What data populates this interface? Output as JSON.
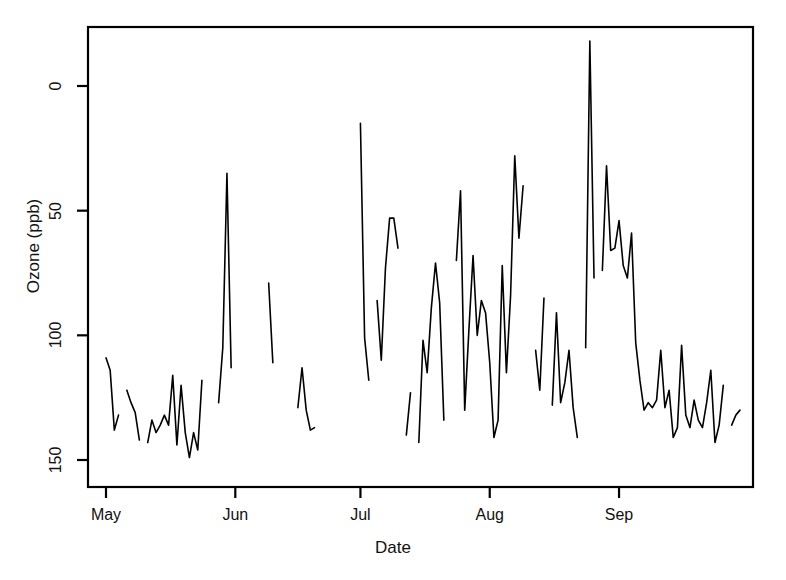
{
  "chart_data": {
    "type": "line",
    "title": "Daily Mean Ozone Concentration, New York (1973)",
    "xlabel": "Date",
    "ylabel": "Ozone (ppb)",
    "ylim": [
      0,
      175
    ],
    "yticks": [
      0,
      50,
      100,
      150
    ],
    "ytick_labels": [
      "0",
      "50",
      "100",
      "150"
    ],
    "xticks": [
      1,
      32,
      62,
      93,
      124
    ],
    "xtick_labels": [
      "May",
      "Jun",
      "Jul",
      "Aug",
      "Sep"
    ],
    "xlim": [
      1,
      153
    ],
    "grid": false,
    "legend": null,
    "line_color": "#000000",
    "line_width": 1.6,
    "background": "#ffffff",
    "series": [
      {
        "name": "Ozone",
        "x_start_label": "May 1",
        "x_end_label": "Sep 30",
        "note": "Missing values (NA) are rendered as breaks in the line",
        "x": [
          1,
          2,
          3,
          4,
          5,
          6,
          7,
          8,
          9,
          10,
          11,
          12,
          13,
          14,
          15,
          16,
          17,
          18,
          19,
          20,
          21,
          22,
          23,
          24,
          25,
          26,
          27,
          28,
          29,
          30,
          31,
          32,
          33,
          34,
          35,
          36,
          37,
          38,
          39,
          40,
          41,
          42,
          43,
          44,
          45,
          46,
          47,
          48,
          49,
          50,
          51,
          52,
          53,
          54,
          55,
          56,
          57,
          58,
          59,
          60,
          61,
          62,
          63,
          64,
          65,
          66,
          67,
          68,
          69,
          70,
          71,
          72,
          73,
          74,
          75,
          76,
          77,
          78,
          79,
          80,
          81,
          82,
          83,
          84,
          85,
          86,
          87,
          88,
          89,
          90,
          91,
          92,
          93,
          94,
          95,
          96,
          97,
          98,
          99,
          100,
          101,
          102,
          103,
          104,
          105,
          106,
          107,
          108,
          109,
          110,
          111,
          112,
          113,
          114,
          115,
          116,
          117,
          118,
          119,
          120,
          121,
          122,
          123,
          124,
          125,
          126,
          127,
          128,
          129,
          130,
          131,
          132,
          133,
          134,
          135,
          136,
          137,
          138,
          139,
          140,
          141,
          142,
          143,
          144,
          145,
          146,
          147,
          148,
          149,
          150,
          151,
          152,
          153
        ],
        "values": [
          41,
          36,
          12,
          18,
          null,
          28,
          23,
          19,
          8,
          null,
          7,
          16,
          11,
          14,
          18,
          14,
          34,
          6,
          30,
          11,
          1,
          11,
          4,
          32,
          null,
          null,
          null,
          23,
          45,
          115,
          37,
          null,
          null,
          null,
          null,
          null,
          null,
          29,
          null,
          71,
          39,
          null,
          null,
          23,
          null,
          null,
          21,
          37,
          20,
          12,
          13,
          null,
          null,
          null,
          null,
          null,
          null,
          null,
          null,
          null,
          null,
          135,
          49,
          32,
          null,
          64,
          40,
          77,
          97,
          97,
          85,
          null,
          10,
          27,
          null,
          7,
          48,
          35,
          61,
          79,
          63,
          16,
          null,
          null,
          80,
          108,
          20,
          52,
          82,
          50,
          64,
          59,
          39,
          9,
          16,
          78,
          35,
          66,
          122,
          89,
          110,
          null,
          null,
          44,
          28,
          65,
          null,
          22,
          59,
          23,
          31,
          44,
          21,
          9,
          null,
          45,
          168,
          73,
          null,
          76,
          118,
          84,
          85,
          96,
          78,
          73,
          91,
          47,
          32,
          20,
          23,
          21,
          24,
          44,
          21,
          28,
          9,
          13,
          46,
          18,
          13,
          24,
          16,
          13,
          23,
          36,
          7,
          14,
          30,
          null,
          14,
          18,
          20
        ]
      }
    ]
  },
  "axes": {
    "box_left": 88,
    "box_right": 753,
    "box_top": 27,
    "box_bottom": 487
  },
  "ticks": {
    "y": [
      {
        "label": "150"
      },
      {
        "label": "100"
      },
      {
        "label": "50"
      },
      {
        "label": "0"
      }
    ],
    "x": [
      {
        "label": "May"
      },
      {
        "label": "Jun"
      },
      {
        "label": "Jul"
      },
      {
        "label": "Aug"
      },
      {
        "label": "Sep"
      }
    ]
  }
}
